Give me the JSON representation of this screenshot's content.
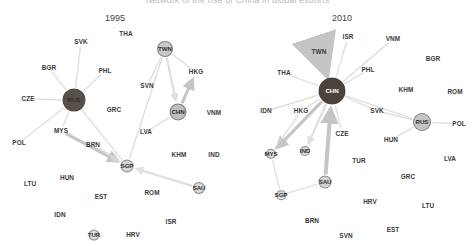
{
  "figure": {
    "title": "Network of the rise of China in global exports",
    "background": "#ffffff"
  },
  "panels": [
    {
      "id": "panel-1995",
      "year_label": "1995",
      "year_pos": {
        "x": 115,
        "y": 18
      },
      "nodes": [
        {
          "id": "RUS",
          "label": "RUS",
          "x": 74,
          "y": 100,
          "r": 11.5,
          "fill": "#595047",
          "text": "#2b2b2b",
          "kind": "hub"
        },
        {
          "id": "TWN",
          "label": "TWN",
          "x": 165,
          "y": 49,
          "r": 8.0,
          "fill": "#c9c9c9",
          "text": "#333333",
          "kind": "hub"
        },
        {
          "id": "CHN",
          "label": "CHN",
          "x": 178,
          "y": 112,
          "r": 8.5,
          "fill": "#bdbdbd",
          "text": "#2e2e2e",
          "kind": "hub"
        },
        {
          "id": "SGP",
          "label": "SGP",
          "x": 127,
          "y": 166,
          "r": 6.5,
          "fill": "#d6d6d6",
          "text": "#333333",
          "kind": "hub"
        },
        {
          "id": "SAU",
          "label": "SAU",
          "x": 199,
          "y": 188,
          "r": 6.0,
          "fill": "#d8d8d8",
          "text": "#333333",
          "kind": "hub"
        },
        {
          "id": "TUR",
          "label": "TUR",
          "x": 94,
          "y": 235,
          "r": 5.5,
          "fill": "#dcdcdc",
          "text": "#333333",
          "kind": "hub"
        }
      ],
      "labels": [
        {
          "id": "SVK",
          "label": "SVK",
          "x": 81,
          "y": 42
        },
        {
          "id": "THA",
          "label": "THA",
          "x": 126,
          "y": 34
        },
        {
          "id": "BGR",
          "label": "BGR",
          "x": 49,
          "y": 68
        },
        {
          "id": "PHL",
          "label": "PHL",
          "x": 105,
          "y": 71
        },
        {
          "id": "HKG",
          "label": "HKG",
          "x": 196,
          "y": 72
        },
        {
          "id": "SVN",
          "label": "SVN",
          "x": 147,
          "y": 86
        },
        {
          "id": "CZE",
          "label": "CZE",
          "x": 28,
          "y": 99
        },
        {
          "id": "GRC",
          "label": "GRC",
          "x": 114,
          "y": 110
        },
        {
          "id": "VNM",
          "label": "VNM",
          "x": 214,
          "y": 113
        },
        {
          "id": "LVA",
          "label": "LVA",
          "x": 146,
          "y": 132
        },
        {
          "id": "MYS",
          "label": "MYS",
          "x": 61,
          "y": 131
        },
        {
          "id": "POL",
          "label": "POL",
          "x": 19,
          "y": 143
        },
        {
          "id": "BRN",
          "label": "BRN",
          "x": 93,
          "y": 145
        },
        {
          "id": "KHM",
          "label": "KHM",
          "x": 179,
          "y": 155
        },
        {
          "id": "IND",
          "label": "IND",
          "x": 214,
          "y": 155
        },
        {
          "id": "HUN",
          "label": "HUN",
          "x": 67,
          "y": 178
        },
        {
          "id": "LTU",
          "label": "LTU",
          "x": 30,
          "y": 184
        },
        {
          "id": "ROM",
          "label": "ROM",
          "x": 152,
          "y": 193
        },
        {
          "id": "EST",
          "label": "EST",
          "x": 101,
          "y": 197
        },
        {
          "id": "IDN",
          "label": "IDN",
          "x": 60,
          "y": 215
        },
        {
          "id": "ISR",
          "label": "ISR",
          "x": 171,
          "y": 222
        },
        {
          "id": "HRV",
          "label": "HRV",
          "x": 133,
          "y": 235
        }
      ],
      "edges": [
        {
          "from": "CZE",
          "to": "RUS",
          "weight": 1,
          "arrow": false
        },
        {
          "from": "RUS",
          "to": "SVK",
          "weight": 1,
          "arrow": false
        },
        {
          "from": "RUS",
          "to": "BGR",
          "weight": 1,
          "arrow": false
        },
        {
          "from": "RUS",
          "to": "PHL",
          "weight": 1,
          "arrow": false
        },
        {
          "from": "RUS",
          "to": "MYS",
          "weight": 1,
          "arrow": false
        },
        {
          "from": "RUS",
          "to": "POL",
          "weight": 1,
          "arrow": false
        },
        {
          "from": "RUS",
          "to": "SGP",
          "weight": 1,
          "arrow": false
        },
        {
          "from": "TWN",
          "to": "CHN",
          "weight": 2,
          "arrow": true
        },
        {
          "from": "TWN",
          "to": "SVN",
          "weight": 1,
          "arrow": false
        },
        {
          "from": "TWN",
          "to": "HKG",
          "weight": 1,
          "arrow": false
        },
        {
          "from": "CHN",
          "to": "HKG",
          "weight": 3,
          "arrow": true
        },
        {
          "from": "CHN",
          "to": "LVA",
          "weight": 1,
          "arrow": false
        },
        {
          "from": "MYS",
          "to": "SGP",
          "weight": 3,
          "arrow": true
        },
        {
          "from": "BRN",
          "to": "SGP",
          "weight": 2,
          "arrow": true
        },
        {
          "from": "SAU",
          "to": "SGP",
          "weight": 2,
          "arrow": true
        },
        {
          "from": "SGP",
          "to": "TWN",
          "weight": 1,
          "arrow": false
        }
      ]
    },
    {
      "id": "panel-2010",
      "year_label": "2010",
      "year_pos": {
        "x": 104,
        "y": 18
      },
      "nodes": [
        {
          "id": "CHN",
          "label": "CHN",
          "x": 94,
          "y": 91,
          "r": 13.5,
          "fill": "#4b4239",
          "text": "#ffffff",
          "kind": "hub"
        },
        {
          "id": "RUS",
          "label": "RUS",
          "x": 184,
          "y": 122,
          "r": 9.0,
          "fill": "#c5c5c5",
          "text": "#333333",
          "kind": "hub"
        },
        {
          "id": "SAU",
          "label": "SAU",
          "x": 87,
          "y": 182,
          "r": 6.5,
          "fill": "#d4d4d4",
          "text": "#333333",
          "kind": "hub"
        },
        {
          "id": "MYS",
          "label": "MYS",
          "x": 33,
          "y": 154,
          "r": 5.2,
          "fill": "#dddddd",
          "text": "#333333",
          "kind": "hub"
        },
        {
          "id": "IND",
          "label": "IND",
          "x": 67,
          "y": 151,
          "r": 5.0,
          "fill": "#dddddd",
          "text": "#333333",
          "kind": "hub"
        },
        {
          "id": "SGP",
          "label": "SGP",
          "x": 43,
          "y": 195,
          "r": 4.8,
          "fill": "#e0e0e0",
          "text": "#333333",
          "kind": "hub"
        }
      ],
      "labels": [
        {
          "id": "ISR",
          "label": "ISR",
          "x": 110,
          "y": 37
        },
        {
          "id": "VNM",
          "label": "VNM",
          "x": 155,
          "y": 39
        },
        {
          "id": "TWN",
          "label": "TWN",
          "x": 81,
          "y": 52
        },
        {
          "id": "BGR",
          "label": "BGR",
          "x": 195,
          "y": 59
        },
        {
          "id": "THA",
          "label": "THA",
          "x": 46,
          "y": 73
        },
        {
          "id": "PHL",
          "label": "PHL",
          "x": 130,
          "y": 70
        },
        {
          "id": "KHM",
          "label": "KHM",
          "x": 168,
          "y": 90
        },
        {
          "id": "ROM",
          "label": "ROM",
          "x": 217,
          "y": 92
        },
        {
          "id": "IDN",
          "label": "IDN",
          "x": 28,
          "y": 111
        },
        {
          "id": "HKG",
          "label": "HKG",
          "x": 63,
          "y": 111
        },
        {
          "id": "SVK",
          "label": "SVK",
          "x": 139,
          "y": 111
        },
        {
          "id": "CZE",
          "label": "CZE",
          "x": 104,
          "y": 134
        },
        {
          "id": "POL",
          "label": "POL",
          "x": 221,
          "y": 124
        },
        {
          "id": "HUN",
          "label": "HUN",
          "x": 153,
          "y": 140
        },
        {
          "id": "TUR",
          "label": "TUR",
          "x": 121,
          "y": 161
        },
        {
          "id": "LVA",
          "label": "LVA",
          "x": 212,
          "y": 159
        },
        {
          "id": "GRC",
          "label": "GRC",
          "x": 170,
          "y": 177
        },
        {
          "id": "HRV",
          "label": "HRV",
          "x": 132,
          "y": 202
        },
        {
          "id": "LTU",
          "label": "LTU",
          "x": 190,
          "y": 206
        },
        {
          "id": "BRN",
          "label": "BRN",
          "x": 74,
          "y": 221
        },
        {
          "id": "EST",
          "label": "EST",
          "x": 155,
          "y": 230
        },
        {
          "id": "SVN",
          "label": "SVN",
          "x": 108,
          "y": 236
        }
      ],
      "edges": [
        {
          "from": "TWN",
          "to": "CHN",
          "weight": 8,
          "arrow": true
        },
        {
          "from": "THA",
          "to": "CHN",
          "weight": 1,
          "arrow": false
        },
        {
          "from": "IDN",
          "to": "CHN",
          "weight": 1,
          "arrow": false
        },
        {
          "from": "HKG",
          "to": "CHN",
          "weight": 1,
          "arrow": false
        },
        {
          "from": "ISR",
          "to": "CHN",
          "weight": 1,
          "arrow": false
        },
        {
          "from": "VNM",
          "to": "CHN",
          "weight": 1,
          "arrow": false
        },
        {
          "from": "PHL",
          "to": "CHN",
          "weight": 1,
          "arrow": false
        },
        {
          "from": "CHN",
          "to": "MYS",
          "weight": 3,
          "arrow": true
        },
        {
          "from": "CHN",
          "to": "IND",
          "weight": 2,
          "arrow": true
        },
        {
          "from": "SAU",
          "to": "CHN",
          "weight": 4,
          "arrow": true
        },
        {
          "from": "CZE",
          "to": "CHN",
          "weight": 1,
          "arrow": false
        },
        {
          "from": "CHN",
          "to": "SVK",
          "weight": 1,
          "arrow": false
        },
        {
          "from": "SVK",
          "to": "RUS",
          "weight": 1,
          "arrow": false
        },
        {
          "from": "CHN",
          "to": "RUS",
          "weight": 1,
          "arrow": false
        },
        {
          "from": "RUS",
          "to": "POL",
          "weight": 1,
          "arrow": false
        },
        {
          "from": "RUS",
          "to": "HUN",
          "weight": 1,
          "arrow": false
        },
        {
          "from": "SAU",
          "to": "SGP",
          "weight": 1,
          "arrow": false
        },
        {
          "from": "SGP",
          "to": "MYS",
          "weight": 1,
          "arrow": false
        },
        {
          "from": "HKG",
          "to": "MYS",
          "weight": 1,
          "arrow": false
        }
      ]
    }
  ],
  "style": {
    "edge_color": "#d8d8d8",
    "edge_color_strong": "#c2c2c2",
    "label_color": "#3a3a3a",
    "year_color": "#444444"
  }
}
